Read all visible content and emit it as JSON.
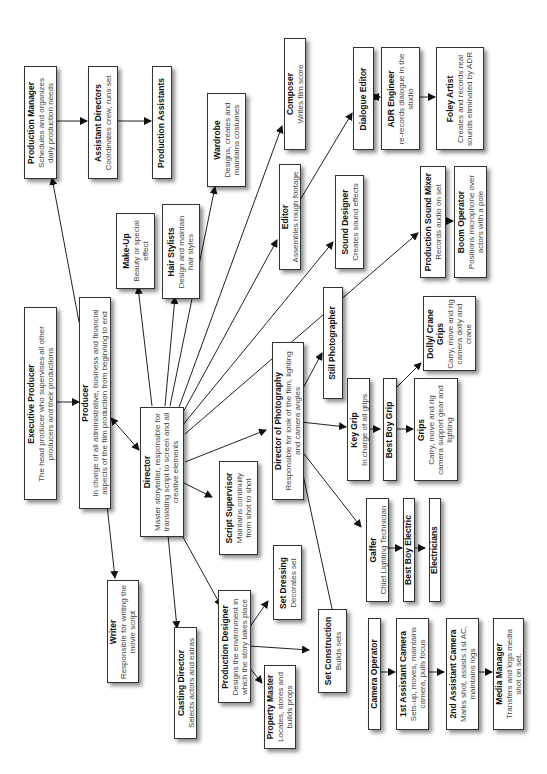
{
  "diagram": {
    "orientation": "rotated 90° counter-clockwise",
    "nodes": {
      "production_manager": {
        "title": "Production Manager",
        "desc": "Schedules and organizes daily production needs"
      },
      "assistant_directors": {
        "title": "Assistant Directors",
        "desc": "Coordinates crew, runs set"
      },
      "production_assistants": {
        "title": "Production Assistants",
        "desc": ""
      },
      "wardrobe": {
        "title": "Wardrobe",
        "desc": "Designs, creates and maintains costumes"
      },
      "composer": {
        "title": "Composer",
        "desc": "Writes film score"
      },
      "dialogue_editor": {
        "title": "Dialogue Editor",
        "desc": ""
      },
      "adr_engineer": {
        "title": "ADR Engineer",
        "desc": "re-records dialogue in the studio"
      },
      "foley_artist": {
        "title": "Foley Artist",
        "desc": "Creates and records real sounds eliminated by ADR"
      },
      "make_up": {
        "title": "Make-Up",
        "desc": "Beauty or special effect"
      },
      "hair_stylists": {
        "title": "Hair Stylists",
        "desc": "Design and maintain hair styles"
      },
      "editor": {
        "title": "Editor",
        "desc": "Assembles rough footage"
      },
      "sound_designer": {
        "title": "Sound Designer",
        "desc": "Creates sound effects"
      },
      "production_sound_mixer": {
        "title": "Production Sound Mixer",
        "desc": "Records audio on set"
      },
      "boom_operator": {
        "title": "Boom Operator",
        "desc": "Positions microphone over actors with a pole"
      },
      "executive_producer": {
        "title": "Executive Producer",
        "desc": "The head producer who supervises all other producers and their productions"
      },
      "producer": {
        "title": "Producer",
        "desc": "In charge of all administrative, business and financial aspects of the film production from beginning to end"
      },
      "director": {
        "title": "Director",
        "desc": "Master storyteller, responsible for translating script to screen and all creative elements"
      },
      "still_photographer": {
        "title": "Still Photographer",
        "desc": ""
      },
      "director_of_photography": {
        "title": "Director of Photography",
        "desc": "Responsible for look of the film, lighting and camera angles"
      },
      "key_grip": {
        "title": "Key Grip",
        "desc": "In charge of all grips"
      },
      "best_boy_grip": {
        "title": "Best Boy Grip",
        "desc": ""
      },
      "grips": {
        "title": "Grips",
        "desc": "Carry, move and rig camera support gear and lighting"
      },
      "dolly_crane_grips": {
        "title": "Dolly/ Crane Grips",
        "desc": "Carry, move and rig camera dolly and crane"
      },
      "script_supervisor": {
        "title": "Script Supervisor",
        "desc": "Maintains continuity from shot to shot"
      },
      "writer": {
        "title": "Writer",
        "desc": "Responsible for writing the movie script"
      },
      "casting_director": {
        "title": "Casting Director",
        "desc": "Selects actors and extras"
      },
      "production_designer": {
        "title": "Production Designer",
        "desc": "Designs the environment in which the story takes place"
      },
      "set_dressing": {
        "title": "Set Dressing",
        "desc": "Decorates set"
      },
      "property_master": {
        "title": "Property Master",
        "desc": "Locates, stores and builds props"
      },
      "set_construction": {
        "title": "Set Construction",
        "desc": "Builds sets"
      },
      "gaffer": {
        "title": "Gaffer",
        "desc": "Chief Lighting Technician"
      },
      "best_boy_electric": {
        "title": "Best Boy Electric",
        "desc": ""
      },
      "electricians": {
        "title": "Electricians",
        "desc": ""
      },
      "camera_operator": {
        "title": "Camera Operator",
        "desc": ""
      },
      "first_assistant_camera": {
        "title": "1st Assistant Camera",
        "desc": "Sets-up, moves, maintains camera, pulls focus"
      },
      "second_assistant_camera": {
        "title": "2nd Assistant Camera",
        "desc": "Marks shot, assists 1st AC, maintains logs"
      },
      "media_manager": {
        "title": "Media Manager",
        "desc": "Transfers and logs media shot on set."
      }
    },
    "edges": [
      [
        "executive_producer",
        "producer"
      ],
      [
        "producer",
        "production_manager"
      ],
      [
        "production_manager",
        "assistant_directors"
      ],
      [
        "assistant_directors",
        "production_assistants"
      ],
      [
        "producer",
        "director",
        "bidirectional"
      ],
      [
        "producer",
        "writer"
      ],
      [
        "director",
        "make_up"
      ],
      [
        "director",
        "hair_stylists"
      ],
      [
        "director",
        "wardrobe"
      ],
      [
        "director",
        "composer"
      ],
      [
        "director",
        "editor"
      ],
      [
        "director",
        "sound_designer"
      ],
      [
        "director",
        "production_sound_mixer"
      ],
      [
        "director",
        "director_of_photography"
      ],
      [
        "director",
        "script_supervisor"
      ],
      [
        "director",
        "casting_director"
      ],
      [
        "director",
        "production_designer"
      ],
      [
        "editor",
        "dialogue_editor"
      ],
      [
        "dialogue_editor",
        "adr_engineer",
        "bidirectional"
      ],
      [
        "adr_engineer",
        "foley_artist"
      ],
      [
        "production_sound_mixer",
        "boom_operator"
      ],
      [
        "director_of_photography",
        "still_photographer"
      ],
      [
        "director_of_photography",
        "key_grip"
      ],
      [
        "director_of_photography",
        "gaffer"
      ],
      [
        "director_of_photography",
        "camera_operator"
      ],
      [
        "key_grip",
        "best_boy_grip"
      ],
      [
        "best_boy_grip",
        "grips"
      ],
      [
        "best_boy_grip",
        "dolly_crane_grips"
      ],
      [
        "gaffer",
        "best_boy_electric"
      ],
      [
        "best_boy_electric",
        "electricians"
      ],
      [
        "production_designer",
        "set_dressing"
      ],
      [
        "production_designer",
        "set_construction"
      ],
      [
        "production_designer",
        "property_master"
      ],
      [
        "camera_operator",
        "first_assistant_camera"
      ],
      [
        "first_assistant_camera",
        "second_assistant_camera"
      ],
      [
        "second_assistant_camera",
        "media_manager"
      ]
    ]
  }
}
